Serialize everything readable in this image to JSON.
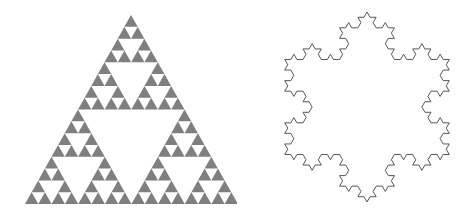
{
  "figures": [
    {
      "name": "sierpinski-triangle",
      "type": "sierpinski",
      "depth": 4,
      "vertices": {
        "apex": [
          131,
          15
        ],
        "bottom_left": [
          25,
          204
        ],
        "bottom_right": [
          238,
          204
        ]
      },
      "fill_color": "#7f7f7f"
    },
    {
      "name": "koch-snowflake",
      "type": "koch",
      "depth": 3,
      "center": [
        367,
        107
      ],
      "radius": 95,
      "stroke_color": "#555555",
      "stroke_width": 1,
      "fill_color": "none"
    }
  ],
  "background_color": "#ffffff"
}
